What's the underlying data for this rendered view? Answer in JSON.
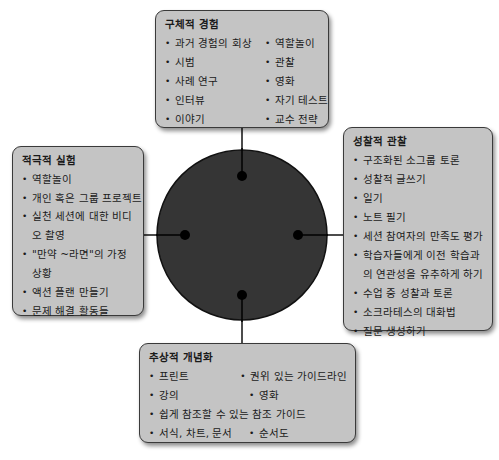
{
  "diagram": {
    "type": "cycle-hub",
    "center": {
      "shape": "circle",
      "fill": "#353535",
      "cx": 242,
      "cy": 235,
      "r": 85
    },
    "connector_color": "#111111",
    "box_fill": "#c4c4c4"
  },
  "boxes": {
    "top": {
      "title": "구체적 경험",
      "col1": [
        "과거 경험의 회상",
        "시범",
        "사례 연구",
        "인터뷰",
        "이야기"
      ],
      "col2": [
        "역할놀이",
        "관찰",
        "영화",
        "자기 테스트",
        "교수 전략"
      ]
    },
    "right": {
      "title": "성찰적 관찰",
      "items": [
        "구조화된 소그룹 토론",
        "성찰적 글쓰기",
        "일기",
        "노트 필기",
        "세션 참여자의 만족도 평가",
        "학습자들에게 이전 학습과의 연관성을 유추하게 하기",
        "수업 중 성찰과 토론",
        "소크라테스의 대화법",
        "질문 생성하기"
      ]
    },
    "left": {
      "title": "적극적 실험",
      "items": [
        "역할놀이",
        "개인 혹은 그룹 프로젝트",
        "실천 세션에 대한 비디오 촬영",
        "\"만약 ~라면\"의 가정 상황",
        "액션 플랜 만들기",
        "문제 해결 활동들"
      ]
    },
    "bottom": {
      "title": "추상적 개념화",
      "rows": [
        [
          "프린트",
          "권위 있는 가이드라인"
        ],
        [
          "강의",
          "영화"
        ],
        [
          "쉽게 참조할 수 있는 참조 가이드"
        ],
        [
          "서식, 차트, 문서",
          "순서도"
        ]
      ]
    }
  }
}
